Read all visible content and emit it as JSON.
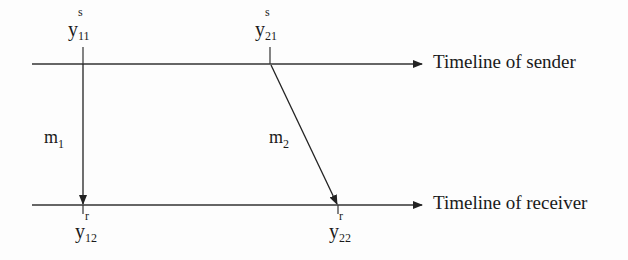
{
  "diagram": {
    "type": "message-sequence-timeline",
    "timelines": [
      {
        "id": "sender",
        "label": "Timeline of sender"
      },
      {
        "id": "receiver",
        "label": "Timeline of receiver"
      }
    ],
    "events": [
      {
        "id": "y11s",
        "base": "y",
        "sup": "s",
        "sub": "11",
        "timeline": "sender"
      },
      {
        "id": "y21s",
        "base": "y",
        "sup": "s",
        "sub": "21",
        "timeline": "sender"
      },
      {
        "id": "y12r",
        "base": "y",
        "sup": "r",
        "sub": "12",
        "timeline": "receiver"
      },
      {
        "id": "y22r",
        "base": "y",
        "sup": "r",
        "sub": "22",
        "timeline": "receiver"
      }
    ],
    "messages": [
      {
        "id": "m1",
        "base": "m",
        "sub": "1",
        "from": "y11s",
        "to": "y12r"
      },
      {
        "id": "m2",
        "base": "m",
        "sub": "2",
        "from": "y21s",
        "to": "y22r"
      }
    ],
    "colors": {
      "line": "#222222",
      "text": "#1a1a1a",
      "background": "#fdfdfd"
    }
  }
}
